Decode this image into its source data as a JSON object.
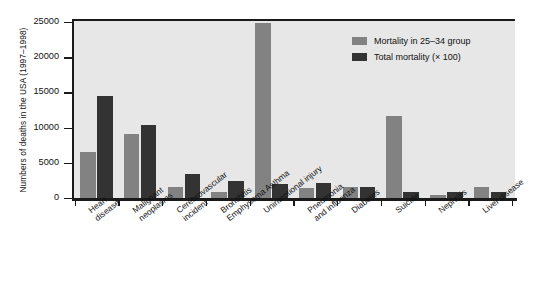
{
  "chart_data": {
    "type": "bar",
    "title": "",
    "xlabel": "",
    "ylabel": "Numbers of deaths in the USA (1997–1998)",
    "ylim": [
      0,
      25000
    ],
    "yticks": [
      0,
      5000,
      10000,
      15000,
      20000,
      25000
    ],
    "ytick_labels": [
      "0",
      "5000",
      "10000",
      "15000",
      "20000",
      "25000"
    ],
    "grid": false,
    "legend_position": "top-right",
    "categories": [
      "Heart disease",
      "Malignant neoplasms",
      "Cerebrovascular incident",
      "Bronchitis Emphysema Asthma",
      "Unintentional injury",
      "Pneumonia and influenza",
      "Diabetes",
      "Suicide",
      "Nephritis",
      "Liver disease"
    ],
    "category_lines": [
      [
        "Heart",
        "disease"
      ],
      [
        "Malignant",
        "neoplasms"
      ],
      [
        "Cerebrovascular",
        "incident"
      ],
      [
        "Bronchitis",
        "Emphysema Asthma"
      ],
      [
        "Unintentional injury"
      ],
      [
        "Pneumonia",
        "and influenza"
      ],
      [
        "Diabetes"
      ],
      [
        "Suicide"
      ],
      [
        "Nephritis"
      ],
      [
        "Liver disease"
      ]
    ],
    "series": [
      {
        "name": "Mortality in 25–34 group",
        "color": "#828282",
        "values": [
          6600,
          9050,
          1600,
          800,
          24800,
          1400,
          1500,
          11700,
          400,
          1500
        ]
      },
      {
        "name": "Total mortality (× 100)",
        "color": "#333333",
        "values": [
          14550,
          10300,
          3400,
          2400,
          2000,
          2200,
          1600,
          900,
          800,
          900
        ]
      }
    ]
  },
  "legend": {
    "items": [
      {
        "label": "Mortality in 25–34 group",
        "color": "#828282"
      },
      {
        "label": "Total mortality (× 100)",
        "color": "#333333"
      }
    ]
  },
  "colors": {
    "series_gray": "#828282",
    "series_dark": "#333333",
    "plot_background": "#e7e7e7",
    "axis": "#1a1a1a",
    "page_background": "#ffffff"
  }
}
